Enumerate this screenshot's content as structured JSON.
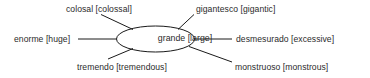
{
  "diagram": {
    "type": "semantic-network",
    "center": {
      "id": "grande",
      "term": "grande",
      "gloss": "large",
      "label": "grande [large]"
    },
    "nodes": [
      {
        "id": "colosal",
        "term": "colosal",
        "gloss": "colossal",
        "label": "colosal [colossal]",
        "position": "top-left",
        "connector": "diagonal"
      },
      {
        "id": "gigantesco",
        "term": "gigantesco",
        "gloss": "gigantic",
        "label": "gigantesco [gigantic]",
        "position": "top-right",
        "connector": "diagonal"
      },
      {
        "id": "enorme",
        "term": "enorme",
        "gloss": "huge",
        "label": "enorme [huge]",
        "position": "left",
        "connector": "horizontal"
      },
      {
        "id": "desmesurado",
        "term": "desmesurado",
        "gloss": "excessive",
        "label": "desmesurado [excessive]",
        "position": "right",
        "connector": "horizontal"
      },
      {
        "id": "tremendo",
        "term": "tremendo",
        "gloss": "tremendous",
        "label": "tremendo [tremendous]",
        "position": "bottom-left",
        "connector": "diagonal"
      },
      {
        "id": "monstruoso",
        "term": "monstruoso",
        "gloss": "monstrous",
        "label": "monstruoso [monstrous]",
        "position": "bottom-right",
        "connector": "diagonal"
      }
    ],
    "colors": {
      "background": "#ffffff",
      "text": "#2b2b2b",
      "stroke": "#1a1a1a"
    }
  }
}
